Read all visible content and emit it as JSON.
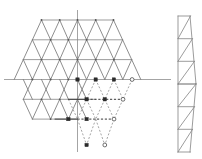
{
  "figure": {
    "width": 202,
    "height": 159,
    "background_color": "#ffffff",
    "colors": {
      "solid_edge": "#7a7a7a",
      "horizontal_edge": "#8a8a8a",
      "dashed_edge": "#8e8e8e",
      "dark_edge": "#3a3a3a",
      "axis": "#9a9a9a",
      "node_plain": "#555555",
      "node_marked": "#2b2b2b",
      "node_open": "#ffffff"
    },
    "geometry": {
      "cell_width": 18.2,
      "row_height": 20,
      "origin_x": 77.5,
      "axis_y": 79.5
    }
  },
  "axes": {
    "horizontal": {
      "x1": 4,
      "y1": 79.5,
      "x2": 171,
      "y2": 79.5,
      "label": ""
    },
    "vertical": {
      "x1": 77.5,
      "y1": 10,
      "x2": 77.5,
      "y2": 152,
      "label": ""
    }
  },
  "lattice_solid": {
    "name": "upper-hexagonal-lattice",
    "rows": [
      {
        "y": 20,
        "x_start": 41.5,
        "x_end": 113.5,
        "count": 5
      },
      {
        "y": 39.8,
        "x_start": 32.4,
        "x_end": 122.6,
        "count": 6
      },
      {
        "y": 59.6,
        "x_start": 23.3,
        "x_end": 131.7,
        "count": 7
      },
      {
        "y": 79.5,
        "x_start": 14.2,
        "x_end": 140.8,
        "count": 8
      },
      {
        "y": 99.3,
        "x_start": 23.3,
        "x_end": 131.7,
        "count": 7
      },
      {
        "y": 119.1,
        "x_start": 32.4,
        "x_end": 122.6,
        "count": 6
      }
    ],
    "horizontal_row_extents": [
      {
        "y": 20,
        "x1": 41.5,
        "x2": 113.5
      },
      {
        "y": 39.8,
        "x1": 32.4,
        "x2": 122.6
      },
      {
        "y": 59.6,
        "x1": 23.3,
        "x2": 131.7
      },
      {
        "y": 79.5,
        "x1": 4.0,
        "x2": 171.0
      },
      {
        "y": 99.3,
        "x1": 23.3,
        "x2": 113.5
      },
      {
        "y": 119.1,
        "x1": 32.4,
        "x2": 77.5
      }
    ]
  },
  "lattice_dashed": {
    "name": "lower-dashed-sublattice",
    "description": "Mirror sublattice drawn with dashed strokes below the horizontal axis",
    "rows": [
      {
        "y": 79.5,
        "x_start": 77.5,
        "x_end": 132.0,
        "count": 4
      },
      {
        "y": 99.3,
        "x_start": 68.4,
        "x_end": 123.0,
        "count": 4
      },
      {
        "y": 119.1,
        "x_start": 59.3,
        "x_end": 114.0,
        "count": 4
      },
      {
        "y": 145.0,
        "x_start": 86.6,
        "x_end": 104.8,
        "count": 2
      }
    ]
  },
  "marked_nodes": {
    "name": "highlighted-lattice-nodes",
    "solid_square_points": [
      {
        "x": 77.5,
        "y": 79.5
      },
      {
        "x": 95.7,
        "y": 79.5
      },
      {
        "x": 113.9,
        "y": 79.5
      },
      {
        "x": 86.6,
        "y": 99.3
      },
      {
        "x": 104.8,
        "y": 99.3
      },
      {
        "x": 68.4,
        "y": 119.1
      },
      {
        "x": 86.6,
        "y": 119.1
      },
      {
        "x": 86.6,
        "y": 145.0
      }
    ],
    "open_circle_points": [
      {
        "x": 132.1,
        "y": 79.5
      },
      {
        "x": 123.0,
        "y": 99.3
      },
      {
        "x": 114.0,
        "y": 119.1
      },
      {
        "x": 104.8,
        "y": 145.0
      }
    ]
  },
  "truss": {
    "name": "vertical-truss-strip",
    "x_left": 178,
    "x_right": 194,
    "y_top": 16,
    "y_bottom": 152,
    "panels": 6,
    "panel_height": 22.7,
    "diagonal_direction": "bottom-left-to-top-right",
    "apex_x": 196,
    "apex_y": 84
  },
  "legend": {
    "solid_label": "",
    "dashed_label": "",
    "node_label": ""
  }
}
